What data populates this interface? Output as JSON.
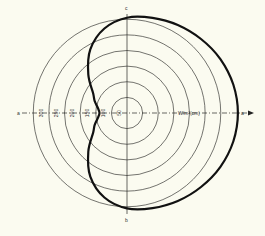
{
  "chart_data": {
    "type": "polar",
    "title": "",
    "center_px": [
      127,
      113
    ],
    "radial_unit_px": 0.3125,
    "rings": [
      50,
      100,
      150,
      200,
      250,
      300
    ],
    "ring_labels": [
      "50",
      "100",
      "150",
      "200",
      "250",
      "300"
    ],
    "radial_axis_label": "W/m²(cm)",
    "axis_end_labels": {
      "left": "a",
      "right": "a",
      "top": "c",
      "bottom": "b"
    },
    "series": [
      {
        "name": "radiation pattern",
        "angles_deg": [
          0,
          15,
          30,
          45,
          60,
          75,
          90,
          105,
          120,
          135,
          150,
          160,
          170,
          180,
          190,
          200,
          210,
          225,
          240,
          255,
          270,
          285,
          300,
          315,
          330,
          345,
          360
        ],
        "values": [
          355,
          352,
          345,
          335,
          325,
          315,
          305,
          280,
          235,
          175,
          125,
          110,
          95,
          88,
          95,
          110,
          125,
          175,
          235,
          280,
          305,
          315,
          325,
          335,
          345,
          352,
          355
        ]
      }
    ],
    "rlim": [
      0,
      360
    ],
    "grid": true
  },
  "colors": {
    "background": "#fbfbf0",
    "grid": "#3a3a36",
    "curve": "#111111"
  }
}
